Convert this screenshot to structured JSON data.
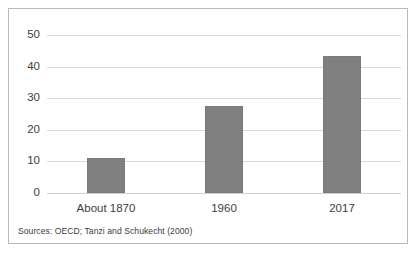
{
  "chart_data": {
    "type": "bar",
    "title": "",
    "xlabel": "",
    "ylabel": "",
    "categories": [
      "About 1870",
      "1960",
      "2017"
    ],
    "values": [
      11.2,
      27.5,
      43.3
    ],
    "ylim": [
      0,
      50
    ],
    "yticks": [
      0,
      10,
      20,
      30,
      40,
      50
    ],
    "ytick_labels": [
      "0",
      "10",
      "20",
      "30",
      "40",
      "50"
    ],
    "grid": true,
    "legend": false,
    "bar_color": "#808080",
    "gridline_color": "#d9d9d9",
    "frame_color": "#b9b9b9",
    "text_color": "#3d3d3d"
  },
  "footnote": {
    "source": "Sources: OECD; Tanzi and Schukecht (2000)"
  }
}
